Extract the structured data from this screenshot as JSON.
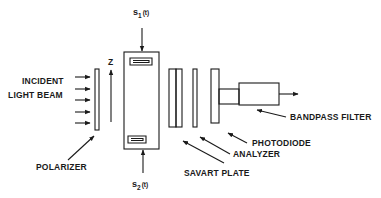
{
  "diagram": {
    "labels": {
      "incident": "INCIDENT",
      "light_beam": "LIGHT BEAM",
      "polarizer": "POLARIZER",
      "z_axis": "Z",
      "signal_top": "s",
      "signal_top_sub": "1",
      "signal_top_arg": "(t)",
      "signal_bottom": "s",
      "signal_bottom_sub": "2",
      "signal_bottom_arg": "(t)",
      "savart_plate": "SAVART PLATE",
      "analyzer": "ANALYZER",
      "photodiode": "PHOTODIODE",
      "bandpass_filter": "BANDPASS FILTER"
    },
    "components": [
      "polarizer",
      "modulator-block",
      "savart-plate",
      "analyzer",
      "photodiode",
      "bandpass-filter"
    ],
    "incident_arrow_count": 5,
    "colors": {
      "ink": "#1a1a1a",
      "background": "#ffffff"
    }
  }
}
